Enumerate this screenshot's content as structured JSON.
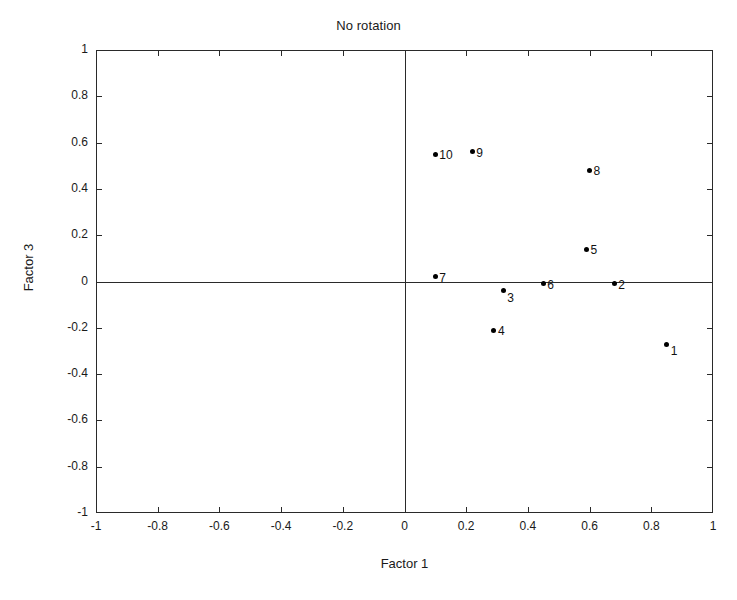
{
  "chart_data": {
    "type": "scatter",
    "title": "No rotation",
    "xlabel": "Factor 1",
    "ylabel": "Factor 3",
    "xlim": [
      -1,
      1
    ],
    "ylim": [
      -1,
      1
    ],
    "grid": false,
    "legend": "none",
    "xticks": [
      -1,
      -0.8,
      -0.6,
      -0.4,
      -0.2,
      0,
      0.2,
      0.4,
      0.6,
      0.8,
      1
    ],
    "yticks": [
      -1,
      -0.8,
      -0.6,
      -0.4,
      -0.2,
      0,
      0.2,
      0.4,
      0.6,
      0.8,
      1
    ],
    "xticklabels": [
      "-1",
      "-0.8",
      "-0.6",
      "-0.4",
      "-0.2",
      "0",
      "0.2",
      "0.4",
      "0.6",
      "0.8",
      "1"
    ],
    "yticklabels": [
      "-1",
      "-0.8",
      "-0.6",
      "-0.4",
      "-0.2",
      "0",
      "0.2",
      "0.4",
      "0.6",
      "0.8",
      "1"
    ],
    "reference_lines": {
      "vertical_x": 0,
      "horizontal_y": 0
    },
    "marker_color": "#000000",
    "marker_style": "filled-circle",
    "points": [
      {
        "label": "1",
        "x": 0.85,
        "y": -0.27
      },
      {
        "label": "2",
        "x": 0.68,
        "y": -0.01
      },
      {
        "label": "3",
        "x": 0.32,
        "y": -0.04
      },
      {
        "label": "4",
        "x": 0.29,
        "y": -0.21
      },
      {
        "label": "5",
        "x": 0.59,
        "y": 0.14
      },
      {
        "label": "6",
        "x": 0.45,
        "y": -0.01
      },
      {
        "label": "7",
        "x": 0.1,
        "y": 0.02
      },
      {
        "label": "8",
        "x": 0.6,
        "y": 0.48
      },
      {
        "label": "9",
        "x": 0.22,
        "y": 0.56
      },
      {
        "label": "10",
        "x": 0.1,
        "y": 0.55
      }
    ]
  }
}
